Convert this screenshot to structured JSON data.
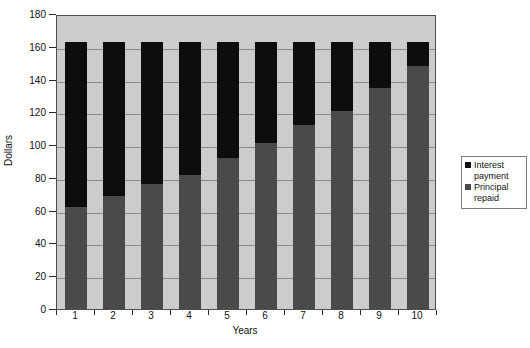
{
  "chart_data": {
    "type": "bar",
    "subtype": "stacked-bar",
    "title": "",
    "xlabel": "Years",
    "ylabel": "Dollars",
    "categories": [
      "1",
      "2",
      "3",
      "4",
      "5",
      "6",
      "7",
      "8",
      "9",
      "10"
    ],
    "series": [
      {
        "name": "Principal repaid",
        "color": "#4a4a4a",
        "values": [
          62,
          69,
          76,
          82,
          92,
          101,
          112,
          121,
          135,
          148
        ]
      },
      {
        "name": "Interest payment",
        "color": "#0d0d0d",
        "values": [
          101,
          94,
          87,
          81,
          71,
          62,
          51,
          42,
          28,
          15
        ]
      }
    ],
    "stack_totals": [
      163,
      163,
      163,
      163,
      163,
      163,
      163,
      163,
      163,
      163
    ],
    "ylim": [
      0,
      180
    ],
    "yticks": [
      0,
      20,
      40,
      60,
      80,
      100,
      120,
      140,
      160,
      180
    ],
    "ytick_labels": [
      "0",
      "20",
      "40",
      "60",
      "80",
      "100",
      "120",
      "140",
      "160",
      "180"
    ],
    "xtick_labels": [
      "1",
      "2",
      "3",
      "4",
      "5",
      "6",
      "7",
      "8",
      "9",
      "10"
    ],
    "grid": true,
    "grid_axis": "y",
    "legend_position": "right",
    "legend_entries": [
      {
        "label_line1": "Interest",
        "label_line2": "payment",
        "swatch": "#0d0d0d"
      },
      {
        "label_line1": "Principal",
        "label_line2": "repaid",
        "swatch": "#4a4a4a"
      }
    ],
    "plot_background": "#cccccc",
    "page_background": "#ffffff"
  },
  "axes": {
    "y_title": "Dollars",
    "x_title": "Years"
  },
  "legend": {
    "interest_line1": "Interest",
    "interest_line2": "payment",
    "principal_line1": "Principal",
    "principal_line2": "repaid"
  }
}
